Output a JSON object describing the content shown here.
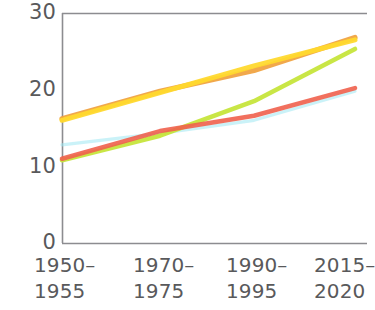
{
  "chart_data": {
    "type": "line",
    "title": "",
    "subtitle": "",
    "xlabel": "",
    "ylabel": "",
    "categories": [
      "1950–\n1955",
      "1970–\n1975",
      "1990–\n1995",
      "2015–\n2020"
    ],
    "category_labels": [
      {
        "line1": "1950–",
        "line2": "1955"
      },
      {
        "line1": "1970–",
        "line2": "1975"
      },
      {
        "line1": "1990–",
        "line2": "1995"
      },
      {
        "line1": "2015–",
        "line2": "2020"
      }
    ],
    "x": [
      0,
      1,
      2,
      3
    ],
    "ylim": [
      0,
      30
    ],
    "yticks": [
      0,
      10,
      20,
      30
    ],
    "ytick_labels": [
      "0",
      "10",
      "20",
      "30"
    ],
    "grid": false,
    "legend": "none",
    "axes": {
      "left_spine": true,
      "bottom_spine": true,
      "top_spine": true,
      "right_spine": false,
      "spine_color": "#8c8c90"
    },
    "series": [
      {
        "name": "series-orange",
        "color": "#f0a13c",
        "values": [
          16.2,
          19.8,
          22.5,
          26.8
        ],
        "width": 5.2,
        "opacity": 0.92
      },
      {
        "name": "series-yellow",
        "color": "#ffd92e",
        "values": [
          16.0,
          19.6,
          23.1,
          26.5
        ],
        "width": 5.0,
        "opacity": 0.95
      },
      {
        "name": "series-green",
        "color": "#c6e53b",
        "values": [
          10.8,
          14.0,
          18.5,
          25.3
        ],
        "width": 4.6,
        "opacity": 0.95
      },
      {
        "name": "series-red",
        "color": "#f0604d",
        "values": [
          11.0,
          14.6,
          16.6,
          20.2
        ],
        "width": 4.6,
        "opacity": 0.9
      },
      {
        "name": "series-cyan",
        "color": "#9fe8f2",
        "values": [
          12.8,
          14.3,
          16.0,
          19.8
        ],
        "width": 3.2,
        "opacity": 0.55
      }
    ]
  },
  "geometry": {
    "plot_left": 62,
    "plot_right": 358,
    "plot_top": 13,
    "plot_bottom": 243,
    "x_positions": [
      62,
      160,
      254,
      355
    ],
    "y_label_tops": [
      2,
      79,
      156,
      232
    ],
    "x_label_lefts": [
      34,
      133,
      226,
      314
    ]
  }
}
